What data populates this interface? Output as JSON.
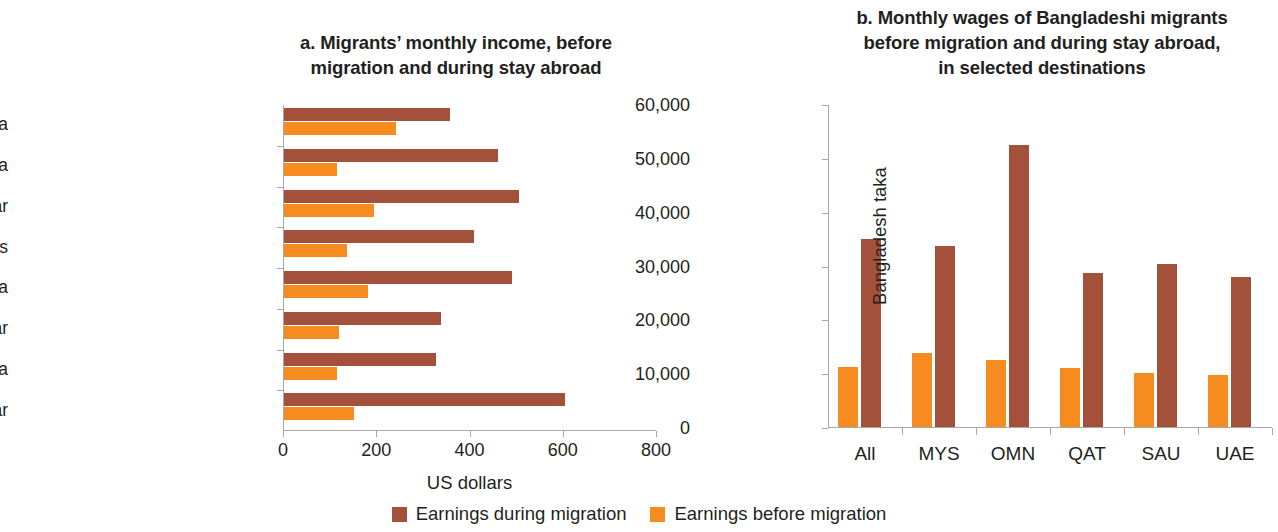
{
  "panel_a": {
    "title": "a. Migrants’ monthly income, before migration and during stay abroad",
    "title_line1": "a. Migrants’ monthly income, before",
    "title_line2": "migration and during stay abroad",
    "xlabel": "US dollars"
  },
  "panel_b": {
    "title": "b. Monthly wages of Bangladeshi migrants before migration and during stay abroad, in selected destinations",
    "title_line1": "b. Monthly wages of Bangladeshi migrants",
    "title_line2": "before migration and during stay abroad,",
    "title_line3": "in selected destinations",
    "ylabel": "Bangladesh taka"
  },
  "legend": {
    "items": [
      {
        "label": "Earnings during migration",
        "color": "#a4513c",
        "key": "during"
      },
      {
        "label": "Earnings before migration",
        "color": "#f68b1f",
        "key": "before"
      }
    ]
  },
  "colors": {
    "during_migration": "#a4513c",
    "before_migration": "#f68b1f",
    "axis": "#a7a9ac",
    "text": "#231f20"
  },
  "chart_data": [
    {
      "id": "panel-a",
      "type": "bar",
      "orientation": "horizontal",
      "title": "a. Migrants’ monthly income, before migration and during stay abroad",
      "xlabel": "US dollars",
      "ylabel": "",
      "xlim": [
        0,
        800
      ],
      "xticks": [
        0,
        200,
        400,
        600,
        800
      ],
      "xtick_labels": [
        "0",
        "200",
        "400",
        "600",
        "800"
      ],
      "grid": false,
      "legend_position": "bottom-center-shared",
      "categories": [
        "Vietnam–Malaysia",
        "Philippines–Saudi Arabia",
        "Philippines–Qatar",
        "Pakistan–United Arab Emirates",
        "Pakistan–Saudi Arabia",
        "Nepal–Qatar",
        "India–Saudi Arabia",
        "India–Qatar"
      ],
      "series": [
        {
          "name": "Earnings during migration",
          "color": "#a4513c",
          "values": [
            355,
            460,
            505,
            408,
            488,
            337,
            325,
            602
          ]
        },
        {
          "name": "Earnings before migration",
          "color": "#f68b1f",
          "values": [
            240,
            113,
            193,
            135,
            180,
            117,
            113,
            150
          ]
        }
      ]
    },
    {
      "id": "panel-b",
      "type": "bar",
      "orientation": "vertical",
      "title": "b. Monthly wages of Bangladeshi migrants before migration and during stay abroad, in selected destinations",
      "xlabel": "",
      "ylabel": "Bangladesh taka",
      "ylim": [
        0,
        60000
      ],
      "yticks": [
        0,
        10000,
        20000,
        30000,
        40000,
        50000,
        60000
      ],
      "ytick_labels": [
        "0",
        "10,000",
        "20,000",
        "30,000",
        "40,000",
        "50,000",
        "60,000"
      ],
      "grid": false,
      "legend_position": "bottom-center-shared",
      "categories": [
        "All",
        "MYS",
        "OMN",
        "QAT",
        "SAU",
        "UAE"
      ],
      "series": [
        {
          "name": "Earnings before migration",
          "color": "#f68b1f",
          "values": [
            11200,
            13700,
            12400,
            10900,
            10000,
            9700
          ]
        },
        {
          "name": "Earnings during migration",
          "color": "#a4513c",
          "values": [
            35000,
            33700,
            52400,
            28600,
            30300,
            27900
          ]
        }
      ]
    }
  ]
}
